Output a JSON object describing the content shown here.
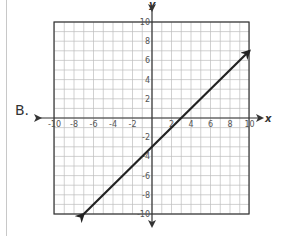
{
  "option": {
    "label": "B."
  },
  "graph": {
    "x_axis_label": "x",
    "y_axis_label": "y",
    "x_range": [
      -10,
      10
    ],
    "y_range": [
      -10,
      10
    ],
    "x_ticks": [
      "-10",
      "-8",
      "-6",
      "-4",
      "-2",
      "2",
      "4",
      "6",
      "8",
      "10"
    ],
    "y_ticks": [
      "10",
      "8",
      "6",
      "4",
      "2",
      "-2",
      "-4",
      "-6",
      "-8",
      "-10"
    ],
    "grid_step": 1,
    "line": {
      "start": [
        -7,
        -10
      ],
      "end": [
        10,
        7
      ],
      "equation": "y = x - 3",
      "color": "#222222"
    }
  },
  "chart_data": {
    "type": "line",
    "title": "",
    "xlabel": "x",
    "ylabel": "y",
    "xlim": [
      -10,
      10
    ],
    "ylim": [
      -10,
      10
    ],
    "grid": true,
    "series": [
      {
        "name": "y = x - 3",
        "x": [
          -7,
          0,
          3,
          10
        ],
        "y": [
          -10,
          -3,
          0,
          7
        ]
      }
    ]
  }
}
